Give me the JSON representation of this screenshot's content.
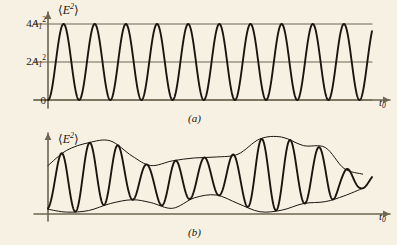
{
  "figure": {
    "background_color": "#f6f1e2",
    "curve_color": "#1b1510",
    "axis_color": "#6e6552"
  },
  "panels": [
    {
      "id": "a",
      "caption": "(a)",
      "y_axis_label_prefix": "⟨",
      "y_axis_label": "E",
      "y_axis_label_exp": "2",
      "y_axis_label_suffix": "⟩",
      "x_axis_label": "t",
      "x_axis_label_sub": "0",
      "ticks": [
        {
          "label_num": "4",
          "label_var": "A",
          "label_sub": "1",
          "label_sup": "2",
          "value": 4
        },
        {
          "label_num": "2",
          "label_var": "A",
          "label_sub": "1",
          "label_sup": "2",
          "value": 2
        },
        {
          "label_num": "0",
          "label_var": "",
          "label_sub": "",
          "label_sup": "",
          "value": 0
        }
      ]
    },
    {
      "id": "b",
      "caption": "(b)",
      "y_axis_label_prefix": "⟨",
      "y_axis_label": "E",
      "y_axis_label_exp": "2",
      "y_axis_label_suffix": "⟩",
      "x_axis_label": "t",
      "x_axis_label_sub": "0",
      "ticks": []
    }
  ],
  "chart_data": [
    {
      "type": "line",
      "panel": "a",
      "title": "",
      "subtitle": "Fully coherent light: interference intensity oscillates fully between 0 and 4A1^2",
      "xlabel": "t_0",
      "ylabel": "<E^2>",
      "xlim": [
        0,
        10.4
      ],
      "ylim": [
        0,
        4.55
      ],
      "yticks": [
        0,
        2,
        4
      ],
      "ytick_labels": [
        "0",
        "2A₁²",
        "4A₁²"
      ],
      "xticks": [],
      "grid": true,
      "gridlines_y": [
        0,
        2,
        4
      ],
      "legend": false,
      "series": [
        {
          "name": "coherent_intensity",
          "formula": "2 + 2*cos(2*pi*x)",
          "amplitude": 2,
          "offset": 2,
          "cycles": 10,
          "period": 1,
          "min": 0,
          "max": 4
        }
      ],
      "envelope_upper": null,
      "envelope_lower": null
    },
    {
      "type": "line",
      "panel": "b",
      "title": "",
      "subtitle": "Partially coherent light: fringe visibility fluctuates; envelopes wander",
      "xlabel": "t_0",
      "ylabel": "<E^2>",
      "xlim": [
        0,
        10.4
      ],
      "ylim": [
        0,
        4.55
      ],
      "yticks": [],
      "ytick_labels": [],
      "xticks": [],
      "grid": false,
      "legend": false,
      "series": [
        {
          "name": "partially_coherent_intensity",
          "cycles": 11,
          "period": 0.92,
          "description": "oscillation bounded by slowly varying upper and lower envelopes"
        }
      ],
      "envelope_upper": {
        "name": "upper_envelope",
        "x": [
          0.0,
          0.6,
          1.3,
          2.0,
          2.7,
          3.3,
          4.0,
          4.7,
          5.4,
          6.1,
          6.8,
          7.5,
          8.2,
          8.9,
          9.5,
          10.1
        ],
        "y": [
          2.55,
          3.35,
          3.75,
          3.85,
          3.05,
          2.55,
          2.8,
          2.95,
          3.0,
          3.15,
          3.95,
          4.05,
          3.6,
          3.5,
          2.4,
          2.1
        ]
      },
      "envelope_lower": {
        "name": "lower_envelope",
        "x": [
          0.0,
          0.6,
          1.3,
          2.0,
          2.7,
          3.3,
          4.0,
          4.7,
          5.4,
          6.1,
          6.8,
          7.5,
          8.2,
          8.9,
          9.5,
          10.1
        ],
        "y": [
          0.25,
          0.1,
          0.18,
          0.55,
          0.75,
          0.6,
          0.3,
          0.85,
          1.0,
          0.55,
          0.12,
          0.2,
          0.55,
          0.65,
          0.95,
          1.35
        ]
      }
    }
  ]
}
